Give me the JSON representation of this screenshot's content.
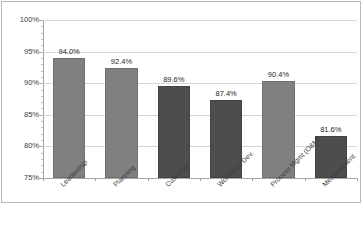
{
  "chart_data": {
    "type": "bar",
    "title": "",
    "subtitle": "",
    "xlabel": "",
    "ylabel": "",
    "categories": [
      "Leadership",
      "Planning",
      "Customer",
      "Workforce Dev.",
      "Process Mgmt (O&M)",
      "Measurement"
    ],
    "values": [
      94.0,
      92.4,
      89.6,
      87.4,
      90.4,
      81.6
    ],
    "data_labels": [
      "94.0%",
      "92.4%",
      "89.6%",
      "87.4%",
      "90.4%",
      "81.6%"
    ],
    "bar_colors": [
      "#808080",
      "#808080",
      "#4d4d4d",
      "#4d4d4d",
      "#808080",
      "#4d4d4d"
    ],
    "ylim": [
      75,
      100
    ],
    "ytick_values": [
      75,
      80,
      85,
      90,
      95,
      100
    ],
    "ytick_labels": [
      "75%",
      "80%",
      "85%",
      "90%",
      "95%",
      "100%"
    ],
    "yminor_interval": 1,
    "grid": true,
    "grid_color": "#d6d6d6",
    "legend": false,
    "legend_position": "none",
    "axis_color": "#a6a6a6",
    "plot_background": "#ffffff"
  }
}
